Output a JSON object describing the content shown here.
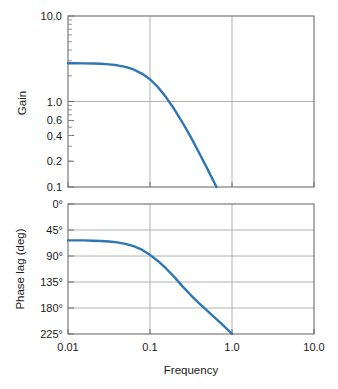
{
  "figure": {
    "background": "#ffffff",
    "curve_color": "#2f76b5",
    "frame_color": "#6e6e6e",
    "grid_color": "#a9a9a9"
  },
  "chart_data": [
    {
      "type": "line",
      "title": "",
      "xlabel": "",
      "ylabel": "Gain",
      "xscale": "log",
      "yscale": "log",
      "xlim": [
        0.01,
        10.0
      ],
      "ylim": [
        0.1,
        10.0
      ],
      "xticks": [
        0.01,
        0.1,
        1.0,
        10.0
      ],
      "xticklabels": [
        "0.01",
        "0.1",
        "1.0",
        "10.0"
      ],
      "yticks": [
        0.1,
        0.2,
        0.4,
        0.6,
        1.0,
        10.0
      ],
      "yticklabels": [
        "0.1",
        "0.2",
        "0.4",
        "0.6",
        "1.0",
        "10.0"
      ],
      "grid": true,
      "series": [
        {
          "name": "gain",
          "x": [
            0.01,
            0.0126,
            0.0158,
            0.02,
            0.0251,
            0.0316,
            0.0398,
            0.0501,
            0.0631,
            0.0794,
            0.1,
            0.126,
            0.158,
            0.2,
            0.251,
            0.316,
            0.398,
            0.501,
            0.631,
            0.794,
            1.0,
            1.26
          ],
          "y": [
            2.8,
            2.8,
            2.79,
            2.78,
            2.76,
            2.72,
            2.65,
            2.54,
            2.37,
            2.12,
            1.82,
            1.46,
            1.11,
            0.8,
            0.56,
            0.38,
            0.25,
            0.163,
            0.105,
            0.067,
            0.043,
            0.027
          ]
        }
      ]
    },
    {
      "type": "line",
      "title": "",
      "xlabel": "Frequency",
      "ylabel": "Phase lag (deg)",
      "xscale": "log",
      "yscale": "linear",
      "xlim": [
        0.01,
        10.0
      ],
      "ylim": [
        225,
        0
      ],
      "xticks": [
        0.01,
        0.1,
        1.0,
        10.0
      ],
      "xticklabels": [
        "0.01",
        "0.1",
        "1.0",
        "10.0"
      ],
      "yticks": [
        0,
        45,
        90,
        135,
        180,
        225
      ],
      "yticklabels": [
        "0°",
        "45°",
        "90°",
        "135°",
        "180°",
        "225°"
      ],
      "grid": true,
      "series": [
        {
          "name": "phase-lag",
          "x": [
            0.01,
            0.0126,
            0.0158,
            0.02,
            0.0251,
            0.0316,
            0.0398,
            0.0501,
            0.0631,
            0.0794,
            0.1,
            0.126,
            0.158,
            0.2,
            0.251,
            0.316,
            0.398,
            0.501,
            0.631,
            0.794,
            1.0
          ],
          "y": [
            63,
            63,
            63,
            63.5,
            64,
            65,
            66.5,
            69,
            73,
            79,
            88,
            99,
            112,
            127,
            143,
            158,
            172,
            185,
            198,
            211,
            225
          ]
        }
      ]
    }
  ],
  "gain_plot": {
    "ylabel": "Gain",
    "ytick_labels": [
      "10.0",
      "1.0",
      "0.6",
      "0.4",
      "0.2",
      "0.1"
    ]
  },
  "phase_plot": {
    "ylabel": "Phase lag (deg)",
    "ytick_labels": [
      "0°",
      "45°",
      "90°",
      "135°",
      "180°",
      "225°"
    ]
  },
  "x_axis": {
    "label": "Frequency",
    "tick_labels": [
      "0.01",
      "0.1",
      "1.0",
      "10.0"
    ]
  }
}
